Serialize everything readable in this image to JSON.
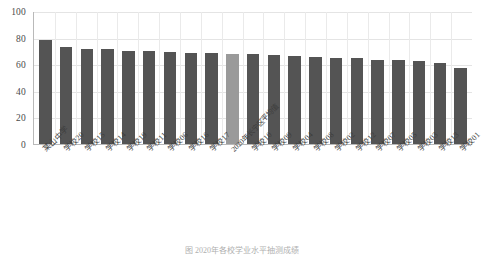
{
  "chart_data": {
    "type": "bar",
    "title": "",
    "xlabel": "",
    "ylabel": "",
    "ylim": [
      0,
      100
    ],
    "yticks": [
      100,
      80,
      60,
      40,
      20,
      0
    ],
    "grid": true,
    "legend": null,
    "categories": [
      "某山中学",
      "学校20",
      "学校15",
      "学校14",
      "学校19",
      "学校11",
      "学校06",
      "学校16",
      "学校17",
      "2020年长宁区平均值",
      "学校10",
      "学校09",
      "学校04",
      "学校08",
      "学校02",
      "学校12",
      "学校07",
      "学校05",
      "学校03",
      "学校13",
      "学校01"
    ],
    "values": [
      78.5,
      73.2,
      71.6,
      71.3,
      70.2,
      70.1,
      69.3,
      68.4,
      68.2,
      67.6,
      67.4,
      67.2,
      66.3,
      65.2,
      64.9,
      64.6,
      63.5,
      63.2,
      62.3,
      60.6,
      57.3
    ],
    "highlight_index": 9,
    "colors": {
      "bar": "#545454",
      "highlight": "#9a9a9a",
      "grid": "#e4e4e4",
      "axis": "#b9b9b9",
      "text": "#3d3d3d"
    }
  },
  "caption": {
    "text": "图 2020年各校学业水平抽测成绩"
  }
}
